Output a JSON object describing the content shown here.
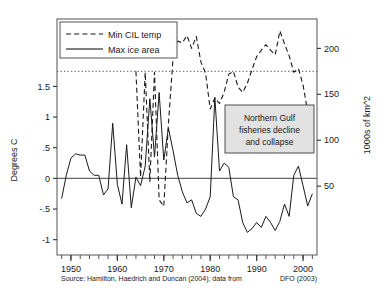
{
  "chart_data": {
    "type": "line",
    "title": "",
    "xlabel": "",
    "ylabel_left": "Degrees C",
    "ylabel_right": "1000s of km^2",
    "xlim": [
      1947,
      2003
    ],
    "ylim_left": [
      -1.25,
      2.6
    ],
    "ylim_right": [
      -25,
      232
    ],
    "grid": false,
    "legend_position": "top-left",
    "xticks": [
      1950,
      1960,
      1970,
      1980,
      1990,
      2000
    ],
    "xtick_labels": [
      "1950",
      "1960",
      "1970",
      "1980",
      "1990",
      "2000"
    ],
    "yticks_left": [
      1.5,
      1,
      0.5,
      0,
      -0.5,
      -1
    ],
    "ytick_labels_left": [
      "1.5",
      "1",
      ".5",
      "0",
      "-.5",
      "-1"
    ],
    "yticks_right": [
      200,
      150,
      100,
      50
    ],
    "ytick_labels_right": [
      "200",
      "150",
      "100",
      "50"
    ],
    "reference_lines": [
      {
        "name": "zero-line",
        "axis": "left",
        "value": 0,
        "style": "solid"
      },
      {
        "name": "cil-reference-line",
        "axis": "right",
        "value": 175,
        "style": "dotted"
      }
    ],
    "series": [
      {
        "name": "Min CIL temp",
        "style": "dashed",
        "axis": "right",
        "x": [
          1964,
          1965,
          1966,
          1967,
          1968,
          1969,
          1970,
          1971,
          1972,
          1973,
          1974,
          1975,
          1976,
          1977,
          1978,
          1979,
          1980,
          1981,
          1982,
          1983,
          1984,
          1985,
          1986,
          1987,
          1988,
          1989,
          1990,
          1991,
          1992,
          1993,
          1994,
          1995,
          1996,
          1997,
          1998,
          1999,
          2000,
          2001
        ],
        "y": [
          175,
          60,
          174,
          55,
          174,
          35,
          28,
          118,
          190,
          208,
          206,
          214,
          200,
          213,
          185,
          173,
          134,
          146,
          140,
          152,
          172,
          175,
          158,
          152,
          162,
          177,
          191,
          198,
          204,
          198,
          193,
          219,
          205,
          192,
          174,
          178,
          160,
          131
        ]
      },
      {
        "name": "Max ice area",
        "style": "solid",
        "axis": "left",
        "x": [
          1948,
          1949,
          1950,
          1951,
          1952,
          1953,
          1954,
          1955,
          1956,
          1957,
          1958,
          1959,
          1960,
          1961,
          1962,
          1963,
          1964,
          1965,
          1966,
          1967,
          1968,
          1969,
          1970,
          1971,
          1972,
          1973,
          1974,
          1975,
          1976,
          1977,
          1978,
          1979,
          1980,
          1981,
          1982,
          1983,
          1984,
          1985,
          1986,
          1987,
          1988,
          1989,
          1990,
          1991,
          1992,
          1993,
          1994,
          1995,
          1996,
          1997,
          1998,
          1999,
          2000,
          2001,
          2002
        ],
        "y": [
          -0.33,
          0.05,
          0.33,
          0.4,
          0.38,
          0.38,
          0.12,
          0.05,
          0.05,
          -0.27,
          -0.17,
          0.9,
          -0.1,
          -0.42,
          0.55,
          -0.48,
          0.02,
          -0.12,
          0.2,
          1.3,
          0.35,
          1.4,
          0.3,
          0.82,
          0.45,
          0.05,
          -0.22,
          -0.4,
          -0.35,
          -0.57,
          -0.62,
          -0.5,
          -0.3,
          1.32,
          0.12,
          0.25,
          0.18,
          -0.3,
          -0.35,
          -0.72,
          -0.88,
          -0.82,
          -0.72,
          -0.8,
          -0.62,
          -0.72,
          -0.85,
          -0.7,
          -0.42,
          -0.62,
          0.05,
          0.2,
          -0.12,
          -0.45,
          -0.25
        ]
      }
    ],
    "annotations": [
      {
        "name": "fisheries-annotation",
        "lines": [
          "Northern Gulf",
          "fisheries decline",
          "and collapse"
        ]
      }
    ]
  },
  "legend": {
    "items": [
      {
        "label": "Min CIL temp",
        "style": "dashed"
      },
      {
        "label": "Max ice area",
        "style": "solid"
      }
    ]
  },
  "source": {
    "left": "Source:  Hamilton, Haedrich and Duncan (2004); data from",
    "right": "DFO (2003)"
  },
  "colors": {
    "line": "#1a1a1a",
    "zero_line": "#555555",
    "anno_fill": "#e2e2e2",
    "anno_border": "#4d4d4d",
    "frame": "#555555"
  }
}
